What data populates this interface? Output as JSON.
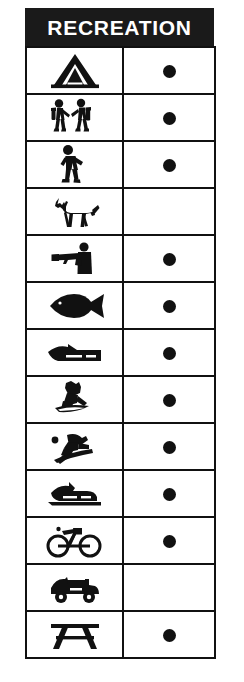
{
  "header": {
    "title": "RECREATION"
  },
  "colors": {
    "header_background": "#1a1a1a",
    "header_text": "#ffffff",
    "border": "#111111",
    "icon": "#111111",
    "dot": "#111111",
    "cell_background": "#ffffff"
  },
  "table": {
    "column_count": 2,
    "row_count": 13,
    "rows": [
      {
        "icon": "tent-icon",
        "activity": "Camping",
        "mark": "●",
        "has_mark": true
      },
      {
        "icon": "hikers-icon",
        "activity": "Hiking",
        "mark": "●",
        "has_mark": true
      },
      {
        "icon": "walking-person-icon",
        "activity": "Walking",
        "mark": "●",
        "has_mark": true
      },
      {
        "icon": "horse-icon",
        "activity": "Horseback Riding",
        "mark": "",
        "has_mark": false
      },
      {
        "icon": "hunter-rifle-icon",
        "activity": "Hunting",
        "mark": "●",
        "has_mark": true
      },
      {
        "icon": "fish-icon",
        "activity": "Fishing",
        "mark": "●",
        "has_mark": true
      },
      {
        "icon": "boat-icon",
        "activity": "Boating",
        "mark": "●",
        "has_mark": true
      },
      {
        "icon": "water-skier-icon",
        "activity": "Water Skiing",
        "mark": "●",
        "has_mark": true
      },
      {
        "icon": "snow-skier-icon",
        "activity": "Snow Skiing",
        "mark": "●",
        "has_mark": true
      },
      {
        "icon": "snowmobile-icon",
        "activity": "Snowmobiling",
        "mark": "●",
        "has_mark": true
      },
      {
        "icon": "bicycle-icon",
        "activity": "Bicycling",
        "mark": "●",
        "has_mark": true
      },
      {
        "icon": "off-road-vehicle-icon",
        "activity": "Off-Road Vehicle",
        "mark": "",
        "has_mark": false
      },
      {
        "icon": "picnic-table-icon",
        "activity": "Picnicking",
        "mark": "●",
        "has_mark": true
      }
    ]
  }
}
